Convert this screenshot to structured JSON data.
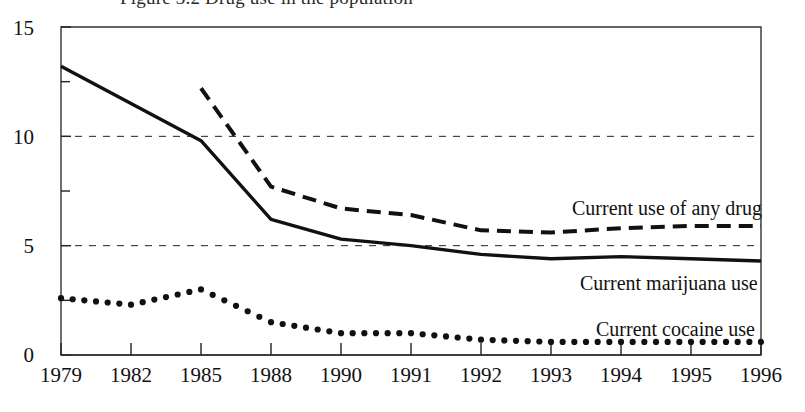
{
  "title": "Figure 3.2  Drug use in the population",
  "chart_data": {
    "type": "line",
    "title": "Figure 3.2  Drug use in the population",
    "xlabel": "",
    "ylabel": "",
    "categories": [
      "1979",
      "1982",
      "1985",
      "1988",
      "1990",
      "1991",
      "1992",
      "1993",
      "1994",
      "1995",
      "1996"
    ],
    "xticklabels": [
      "1979",
      "1982",
      "1985",
      "1988",
      "1990",
      "1991",
      "1992",
      "1993",
      "1994",
      "1995",
      "1996"
    ],
    "yticklabels": [
      "0",
      "5",
      "10",
      "15"
    ],
    "yticks": [
      0,
      5,
      10,
      15
    ],
    "yminorticks": [
      2.5,
      7.5,
      12.5
    ],
    "ylim": [
      0,
      15
    ],
    "grid": "horizontal dashed at 5 and 10",
    "legend_position": "inline right of each series",
    "series": [
      {
        "name": "Current use of any drug",
        "style": "dashed",
        "color": "#111111",
        "x": [
          "1985",
          "1988",
          "1990",
          "1991",
          "1992",
          "1993",
          "1994",
          "1995",
          "1996"
        ],
        "values": [
          12.2,
          7.7,
          6.7,
          6.4,
          5.7,
          5.6,
          5.8,
          5.9,
          5.9
        ]
      },
      {
        "name": "Current marijuana use",
        "style": "solid",
        "color": "#111111",
        "x": [
          "1979",
          "1982",
          "1985",
          "1988",
          "1990",
          "1991",
          "1992",
          "1993",
          "1994",
          "1995",
          "1996"
        ],
        "values": [
          13.2,
          11.5,
          9.8,
          6.2,
          5.3,
          5.0,
          4.6,
          4.4,
          4.5,
          4.4,
          4.3
        ]
      },
      {
        "name": "Current cocaine use",
        "style": "dotted",
        "color": "#111111",
        "x": [
          "1979",
          "1982",
          "1985",
          "1988",
          "1990",
          "1991",
          "1992",
          "1993",
          "1994",
          "1995",
          "1996"
        ],
        "values": [
          2.6,
          2.3,
          3.0,
          1.5,
          1.0,
          1.0,
          0.7,
          0.6,
          0.6,
          0.6,
          0.6
        ]
      }
    ]
  },
  "axes": {
    "y_labels": [
      "15",
      "10",
      "5",
      "0"
    ],
    "x_labels": [
      "1979",
      "1982",
      "1985",
      "1988",
      "1990",
      "1991",
      "1992",
      "1993",
      "1994",
      "1995",
      "1996"
    ]
  },
  "annotations": {
    "any_drug": "Current use of any drug",
    "marijuana": "Current marijuana use",
    "cocaine": "Current cocaine use"
  }
}
